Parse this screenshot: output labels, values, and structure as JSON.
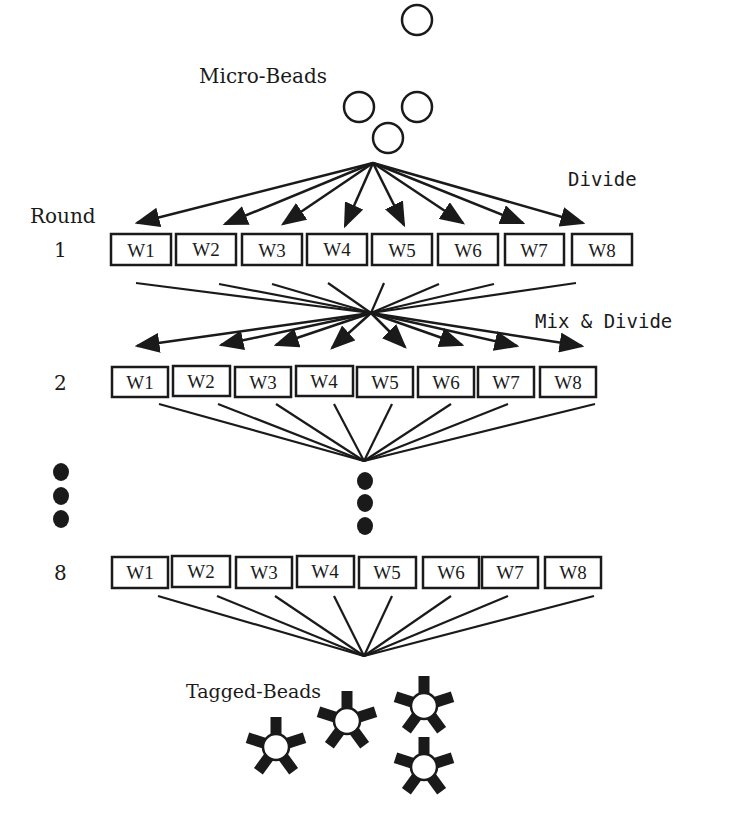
{
  "diagram": {
    "type": "split-and-pool combinatorial synthesis",
    "labels": {
      "micro_beads": "Micro-Beads",
      "divide": "Divide",
      "round_header": "Round",
      "mix_divide": "Mix & Divide",
      "tagged_beads": "Tagged-Beads"
    },
    "rounds": [
      {
        "number": "1",
        "wells": [
          "W1",
          "W2",
          "W3",
          "W4",
          "W5",
          "W6",
          "W7",
          "W8"
        ]
      },
      {
        "number": "2",
        "wells": [
          "W1",
          "W2",
          "W3",
          "W4",
          "W5",
          "W6",
          "W7",
          "W8"
        ]
      },
      {
        "number": "8",
        "wells": [
          "W1",
          "W2",
          "W3",
          "W4",
          "W5",
          "W6",
          "W7",
          "W8"
        ]
      }
    ],
    "continuation": "vertical ellipsis (rounds 3-7 omitted)",
    "input": {
      "name": "Micro-Beads",
      "count": 4,
      "shape": "open circle"
    },
    "output": {
      "name": "Tagged-Beads",
      "count": 4,
      "shape": "circle with 5 tags"
    },
    "colors": {
      "stroke": "#1a1a1a",
      "background": "#ffffff"
    }
  }
}
